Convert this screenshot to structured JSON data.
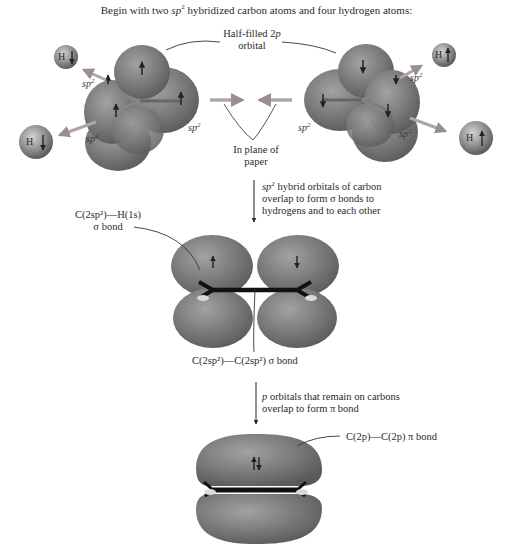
{
  "title": {
    "pre": "Begin with two ",
    "sp": "sp",
    "sup": "2",
    "post": " hybridized carbon atoms and four hydrogen atoms:"
  },
  "top_labels": {
    "half_filled_line1": "Half-filled 2",
    "half_filled_p": "p",
    "half_filled_line2": "orbital",
    "in_plane_line1": "In plane of",
    "in_plane_line2": "paper",
    "sp2_base": "sp",
    "sp2_sup": "2"
  },
  "hydrogens": [
    {
      "label": "H",
      "spin": "down",
      "position": "top-left"
    },
    {
      "label": "H",
      "spin": "down",
      "position": "bottom-left"
    },
    {
      "label": "H",
      "spin": "up",
      "position": "top-right"
    },
    {
      "label": "H",
      "spin": "up",
      "position": "bottom-right"
    }
  ],
  "step1": {
    "line1_sp": "sp",
    "line1_sup": "2",
    "line1_rest": " hybrid orbitals of carbon",
    "line2": "overlap to form σ bonds to",
    "line3": "hydrogens and to each other"
  },
  "sigma_labels": {
    "ch_line1": "C(2sp²)—H(1s)",
    "ch_line2": "σ bond",
    "cc": "C(2sp²)—C(2sp²) σ bond"
  },
  "step2": {
    "line1_p": "p",
    "line1_rest": " orbitals that remain on carbons",
    "line2": "overlap to form π bond"
  },
  "pi_label": "C(2p)—C(2p) π bond",
  "colors": {
    "orbital": "#7a7a7a",
    "orbital_dark": "#5e5e5e",
    "orbital_light": "#9a9a9a",
    "hydrogen": "#8c8c8c",
    "bond": "#111111",
    "text": "#2a2a2a"
  }
}
